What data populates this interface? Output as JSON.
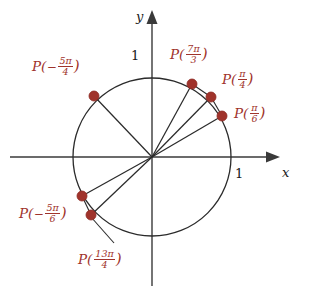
{
  "figure": {
    "background_color": "#ffffff",
    "width": 310,
    "height": 292
  },
  "colors": {
    "point": "#a0332b",
    "point_stroke": "#8d2a22",
    "label": "#a0332b",
    "axis": "#3a3a3a",
    "circle": "#2b2b2b",
    "radius_line": "#2b2b2b",
    "leader": "#2b2b2b",
    "tick_text": "#1a1a1a"
  },
  "axes": {
    "origin": {
      "x": 152,
      "y": 157
    },
    "radius_px": 79,
    "x_axis": {
      "label": "x",
      "label_x": 282,
      "label_y": 174,
      "from_x": 10,
      "to_x": 272,
      "y": 157
    },
    "y_axis": {
      "label": "y",
      "label_x": 136,
      "label_y": 10,
      "x": 152,
      "from_y": 282,
      "to_y": 14
    },
    "ticks": [
      {
        "name": "y-tick-one",
        "text": "1",
        "x": 131,
        "y": 49
      },
      {
        "name": "x-tick-one",
        "text": "1",
        "x": 235,
        "y": 167
      }
    ]
  },
  "points": [
    {
      "name": "point-7pi-over-3",
      "angle_deg": 60,
      "x": 192,
      "y": 84,
      "label": {
        "prefix": "P(",
        "sign": "",
        "numerator": "7π",
        "denominator": "3",
        "suffix": ")",
        "text": "P(7π/3)",
        "x": 170,
        "y": 44
      }
    },
    {
      "name": "point-pi-over-4",
      "angle_deg": 45,
      "x": 211,
      "y": 97,
      "label": {
        "prefix": "P(",
        "sign": "",
        "numerator": "π",
        "denominator": "4",
        "suffix": ")",
        "text": "P(π/4)",
        "x": 222,
        "y": 69
      }
    },
    {
      "name": "point-pi-over-6",
      "angle_deg": 30,
      "x": 222,
      "y": 116,
      "label": {
        "prefix": "P(",
        "sign": "",
        "numerator": "π",
        "denominator": "6",
        "suffix": ")",
        "text": "P(π/6)",
        "x": 234,
        "y": 103
      }
    },
    {
      "name": "point-negative-5pi-over-4",
      "angle_deg": 135,
      "x": 94,
      "y": 96,
      "label": {
        "prefix": "P(",
        "sign": "−",
        "numerator": "5π",
        "denominator": "4",
        "suffix": ")",
        "text": "P(−5π/4)",
        "x": 32,
        "y": 56
      }
    },
    {
      "name": "point-negative-5pi-over-6",
      "angle_deg": 210,
      "x": 82,
      "y": 196,
      "label": {
        "prefix": "P(",
        "sign": "−",
        "numerator": "5π",
        "denominator": "6",
        "suffix": ")",
        "text": "P(−5π/6)",
        "x": 19,
        "y": 203
      }
    },
    {
      "name": "point-13pi-over-4",
      "angle_deg": 225,
      "x": 91,
      "y": 215,
      "label": {
        "prefix": "P(",
        "sign": "",
        "numerator": "13π",
        "denominator": "4",
        "suffix": ")",
        "text": "P(13π/4)",
        "x": 78,
        "y": 249
      }
    }
  ],
  "leader_line": {
    "name": "leader-13pi-over-4",
    "from": {
      "x": 91,
      "y": 217
    },
    "to": {
      "x": 114,
      "y": 243
    }
  }
}
